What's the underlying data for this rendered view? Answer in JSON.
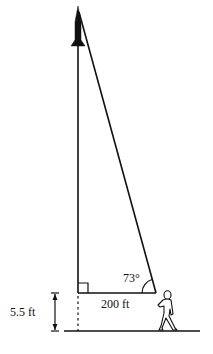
{
  "diagram": {
    "type": "right-triangle-angle-of-elevation",
    "labels": {
      "angle": "73°",
      "base": "200 ft",
      "eye_height": "5.5 ft"
    },
    "elements": {
      "object_at_top": "rocket",
      "observer": "walking person",
      "right_angle_marker": true
    },
    "colors": {
      "stroke": "#111111",
      "background": "#ffffff"
    }
  }
}
